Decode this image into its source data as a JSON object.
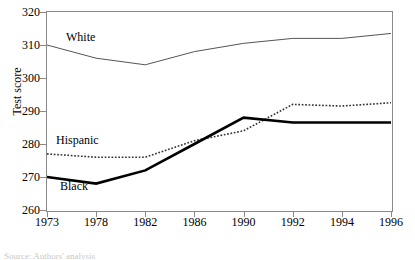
{
  "chart_data": {
    "type": "line",
    "title": "",
    "xlabel": "",
    "ylabel": "Test score",
    "categories": [
      "1973",
      "1978",
      "1982",
      "1986",
      "1990",
      "1992",
      "1994",
      "1996"
    ],
    "ylim": [
      260,
      320
    ],
    "yticks": [
      260,
      270,
      280,
      290,
      300,
      310,
      320
    ],
    "grid": false,
    "legend_position": "inline-annotations",
    "series": [
      {
        "name": "White",
        "style": "thin-solid",
        "color": "#555555",
        "values": [
          310,
          306,
          304,
          308,
          310.5,
          312,
          312,
          313.5
        ]
      },
      {
        "name": "Hispanic",
        "style": "dotted",
        "color": "#333333",
        "values": [
          277,
          276,
          276,
          281,
          284,
          292,
          291.5,
          292.5
        ]
      },
      {
        "name": "Black",
        "style": "thick-solid",
        "color": "#000000",
        "values": [
          270,
          268,
          272,
          280,
          288,
          286.5,
          286.5,
          286.5
        ]
      }
    ],
    "annotations": [
      {
        "text": "White",
        "series": "White"
      },
      {
        "text": "Hispanic",
        "series": "Hispanic"
      },
      {
        "text": "Black",
        "series": "Black"
      }
    ]
  },
  "axis": {
    "y_title": "Test score",
    "y_tick_labels": [
      "320",
      "310",
      "300",
      "290",
      "280",
      "270",
      "260"
    ],
    "x_tick_labels": [
      "1973",
      "1978",
      "1982",
      "1986",
      "1990",
      "1992",
      "1994",
      "1996"
    ]
  },
  "labels": {
    "white": "White",
    "hispanic": "Hispanic",
    "black": "Black"
  },
  "note": {
    "text": "Source: Authors' analysis"
  }
}
